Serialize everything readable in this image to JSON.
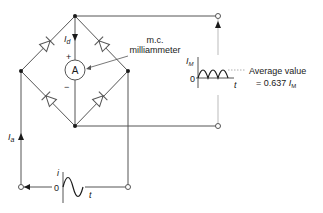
{
  "diagram": {
    "type": "bridge-rectifier-with-mc-milliammeter",
    "labels": {
      "meter_type_line1": "m.c.",
      "meter_type_line2": "milliammeter",
      "meter_symbol": "A",
      "plus": "+",
      "minus": "−",
      "dc_current": "I",
      "dc_current_sub": "d",
      "ac_current": "I",
      "ac_current_sub": "a",
      "output_peak": "I",
      "output_peak_sub": "M",
      "output_zero": "0",
      "output_time": "t",
      "average_line1": "Average value",
      "average_line2_prefix": "= 0.637 ",
      "average_line2_var": "I",
      "average_line2_sub": "M",
      "input_current": "i",
      "input_zero": "0",
      "input_time": "t"
    },
    "components": [
      "diode-top-left",
      "diode-top-right",
      "diode-bottom-left",
      "diode-bottom-right",
      "ammeter"
    ],
    "colors": {
      "line": "#555555",
      "node": "#1a1a1a",
      "text": "#1a1a1a"
    }
  }
}
